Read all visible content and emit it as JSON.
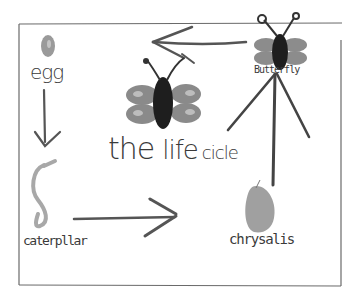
{
  "diagram": {
    "title_parts": {
      "the": "the",
      "life": "life",
      "cicle": "cicle"
    },
    "stages": [
      {
        "id": "egg",
        "label": "egg"
      },
      {
        "id": "caterpillar",
        "label": "caterpllar"
      },
      {
        "id": "chrysalis",
        "label": "chrysalis"
      },
      {
        "id": "butterfly",
        "label": "Butterfly"
      }
    ],
    "arrows": [
      {
        "from": "egg",
        "to": "caterpillar",
        "direction": "down"
      },
      {
        "from": "caterpillar",
        "to": "chrysalis",
        "direction": "right"
      },
      {
        "from": "chrysalis",
        "to": "butterfly",
        "direction": "up"
      },
      {
        "from": "butterfly",
        "to": "egg",
        "direction": "left"
      }
    ],
    "colors": {
      "frame": "#6a6a6a",
      "pencil": "#444444",
      "egg": "#9a9a9a",
      "caterpillar": "#a8a8a8",
      "chrysalis": "#a0a0a0",
      "wing": "#8c8c8c",
      "body": "#1e1e1e"
    }
  }
}
